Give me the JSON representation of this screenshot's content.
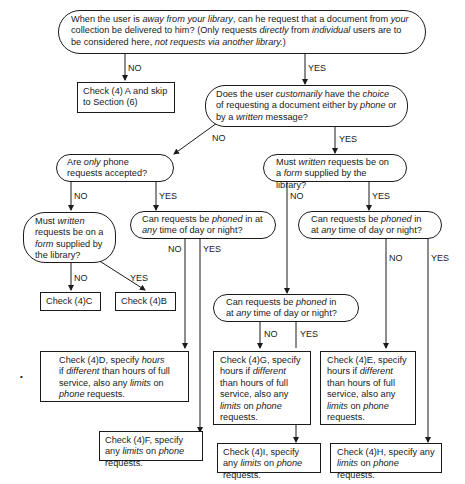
{
  "diagram": {
    "type": "flowchart",
    "nodes": {
      "q1": {
        "kind": "decision",
        "parts": [
          "When the user is ",
          "away from your library",
          ", can he request that a document from ",
          "your",
          " collection be delivered to him? (Only requests ",
          "directly",
          " from ",
          "individual",
          " users are to be considered here, ",
          "not requests via another library.",
          ")"
        ]
      },
      "a_check4a": {
        "kind": "action",
        "text": "Check (4) A and skip to Section (6)"
      },
      "q2": {
        "kind": "decision",
        "parts": [
          "Does the user ",
          "customarily",
          " have the ",
          "choice",
          " of requesting a document either by ",
          "phone",
          " or by a ",
          "written",
          " message?"
        ]
      },
      "q3": {
        "kind": "decision",
        "parts": [
          "Are ",
          "only",
          " phone requests accepted?"
        ]
      },
      "q4": {
        "kind": "decision",
        "parts": [
          "Must ",
          "written",
          " requests be on a ",
          "form",
          " supplied by the library?"
        ]
      },
      "q5": {
        "kind": "decision",
        "parts": [
          "Must ",
          "written",
          " requests be on a ",
          "form",
          " supplied by the library?"
        ]
      },
      "q6": {
        "kind": "decision",
        "parts": [
          "Can requests be ",
          "phoned",
          " in at ",
          "any",
          " time of day or night?"
        ]
      },
      "q7": {
        "kind": "decision",
        "parts": [
          "Can requests be ",
          "phoned",
          " in at ",
          "any",
          " time of day or night?"
        ]
      },
      "q8": {
        "kind": "decision",
        "parts": [
          "Can requests be ",
          "phoned",
          " in at ",
          "any",
          " time of day or night?"
        ]
      },
      "a_check4c": {
        "kind": "action",
        "text": "Check (4)C"
      },
      "a_check4b": {
        "kind": "action",
        "text": "Check (4)B"
      },
      "a_check4d": {
        "kind": "action",
        "parts": [
          "Check (4)D, specify ",
          "hours",
          " if ",
          "different",
          " than hours of full service, also any ",
          "limits",
          " on ",
          "phone",
          " requests."
        ]
      },
      "a_check4g": {
        "kind": "action",
        "parts": [
          "Check (4)G, specify hours if ",
          "different",
          " than hours of full service, also any ",
          "limits",
          " on ",
          "phone",
          " requests."
        ]
      },
      "a_check4e": {
        "kind": "action",
        "parts": [
          "Check (4)E, specify hours if ",
          "different",
          " than hours of full service, also any ",
          "limits",
          " on ",
          "phone",
          " requests."
        ]
      },
      "a_check4f": {
        "kind": "action",
        "parts": [
          "Check (4)F, specify any ",
          "limits",
          " on ",
          "phone",
          " requests."
        ]
      },
      "a_check4i": {
        "kind": "action",
        "parts": [
          "Check (4)I, specify any ",
          "limits",
          " on ",
          "phone",
          " requests."
        ]
      },
      "a_check4h": {
        "kind": "action",
        "parts": [
          "Check (4)H, specify any ",
          "limits",
          " on ",
          "phone",
          " requests."
        ]
      }
    },
    "edge_labels": {
      "no": "NO",
      "yes": "YES"
    },
    "edges": [
      {
        "from": "q1",
        "to": "a_check4a",
        "label": "NO"
      },
      {
        "from": "q1",
        "to": "q2",
        "label": "YES"
      },
      {
        "from": "q2",
        "to": "q3",
        "label": "NO"
      },
      {
        "from": "q2",
        "to": "q5",
        "label": "YES"
      },
      {
        "from": "q3",
        "to": "q4",
        "label": "NO"
      },
      {
        "from": "q3",
        "to": "q6",
        "label": "YES"
      },
      {
        "from": "q4",
        "to": "a_check4c",
        "label": "NO"
      },
      {
        "from": "q4",
        "to": "a_check4b",
        "label": "YES"
      },
      {
        "from": "q6",
        "to": "a_check4d",
        "label": "NO"
      },
      {
        "from": "q6",
        "to": "a_check4f",
        "label": "YES"
      },
      {
        "from": "q5",
        "to": "q8",
        "label": "NO"
      },
      {
        "from": "q5",
        "to": "q7",
        "label": "YES"
      },
      {
        "from": "q8",
        "to": "a_check4g",
        "label": "NO"
      },
      {
        "from": "q8",
        "to": "a_check4i",
        "label": "YES"
      },
      {
        "from": "q7",
        "to": "a_check4e",
        "label": "NO"
      },
      {
        "from": "q7",
        "to": "a_check4h",
        "label": "YES"
      }
    ],
    "stray_mark": "•"
  }
}
